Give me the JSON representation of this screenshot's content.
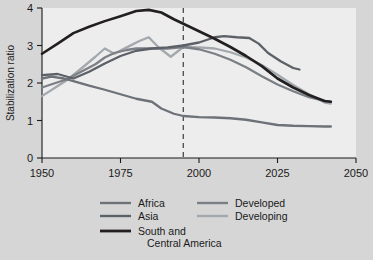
{
  "chart_data": {
    "type": "line",
    "title": "",
    "xlabel": "",
    "ylabel": "Stabilization ratio",
    "xlim": [
      1950,
      2050
    ],
    "ylim": [
      0,
      4
    ],
    "xticks": [
      1950,
      1975,
      2000,
      2025,
      2050
    ],
    "yticks": [
      0,
      1,
      2,
      3,
      4
    ],
    "grid": false,
    "legend_position": "bottom",
    "annotations": [
      {
        "type": "vertical-dashed-line",
        "x": 1995,
        "label": ""
      }
    ],
    "series": [
      {
        "name": "Africa",
        "color": "#6d7278",
        "x": [
          1950,
          1953,
          1957,
          1960,
          1965,
          1970,
          1975,
          1980,
          1985,
          1988,
          1992,
          1995,
          2000,
          2005,
          2010,
          2015,
          2020,
          2025,
          2030,
          2035,
          2040,
          2042
        ],
        "y": [
          2.12,
          2.17,
          2.12,
          2.05,
          1.93,
          1.82,
          1.7,
          1.58,
          1.5,
          1.32,
          1.18,
          1.12,
          1.09,
          1.08,
          1.06,
          1.02,
          0.95,
          0.88,
          0.86,
          0.85,
          0.84,
          0.84
        ]
      },
      {
        "name": "Asia",
        "color": "#5c6168",
        "x": [
          1950,
          1955,
          1960,
          1965,
          1970,
          1975,
          1980,
          1985,
          1990,
          1995,
          2000,
          2005,
          2008,
          2012,
          2016,
          2019,
          2022,
          2026,
          2030,
          2032
        ],
        "y": [
          2.21,
          2.24,
          2.12,
          2.3,
          2.52,
          2.72,
          2.86,
          2.92,
          2.95,
          3.0,
          3.08,
          3.22,
          3.25,
          3.22,
          3.2,
          3.05,
          2.8,
          2.58,
          2.4,
          2.36
        ]
      },
      {
        "name": "South and Central America",
        "color": "#231f20",
        "x": [
          1950,
          1955,
          1960,
          1965,
          1970,
          1975,
          1980,
          1984,
          1988,
          1992,
          1995,
          2000,
          2005,
          2010,
          2015,
          2020,
          2025,
          2030,
          2035,
          2040,
          2042
        ],
        "y": [
          2.78,
          3.05,
          3.33,
          3.5,
          3.65,
          3.78,
          3.92,
          3.95,
          3.88,
          3.7,
          3.58,
          3.38,
          3.18,
          2.96,
          2.72,
          2.45,
          2.12,
          1.88,
          1.68,
          1.52,
          1.5
        ]
      },
      {
        "name": "Developed",
        "color": "#7b8086",
        "x": [
          1950,
          1955,
          1958,
          1962,
          1967,
          1970,
          1973,
          1977,
          1980,
          1985,
          1990,
          1995,
          2000,
          2005,
          2010,
          2015,
          2020,
          2025,
          2030,
          2035,
          2040,
          2042
        ],
        "y": [
          1.88,
          2.02,
          2.1,
          2.28,
          2.5,
          2.68,
          2.8,
          2.88,
          2.92,
          2.92,
          2.92,
          2.96,
          2.9,
          2.78,
          2.62,
          2.42,
          2.18,
          1.96,
          1.78,
          1.62,
          1.52,
          1.5
        ]
      },
      {
        "name": "Developing",
        "color": "#a3a8ad",
        "x": [
          1950,
          1955,
          1958,
          1963,
          1967,
          1970,
          1973,
          1977,
          1981,
          1984,
          1987,
          1991,
          1995,
          2000,
          2005,
          2010,
          2015,
          2020,
          2025,
          2030,
          2035,
          2040,
          2042
        ],
        "y": [
          1.65,
          1.92,
          2.08,
          2.42,
          2.7,
          2.92,
          2.78,
          2.95,
          3.12,
          3.22,
          2.96,
          2.7,
          2.96,
          2.95,
          2.92,
          2.82,
          2.68,
          2.48,
          2.22,
          1.95,
          1.7,
          1.48,
          1.45
        ]
      }
    ]
  },
  "legend": {
    "entries": [
      {
        "label": "Africa"
      },
      {
        "label": "Asia"
      },
      {
        "label": "South and",
        "label2": "Central America"
      },
      {
        "label": "Developed"
      },
      {
        "label": "Developing"
      }
    ]
  },
  "axes": {
    "y_title": "Stabilization ratio",
    "yticks": [
      "0",
      "1",
      "2",
      "3",
      "4"
    ],
    "xticks": [
      "1950",
      "1975",
      "2000",
      "2025",
      "2050"
    ]
  },
  "colors": {
    "page_bg": "#d6d6d6",
    "plot_bg": "#ededed",
    "axis": "#1a1a1a",
    "dashed": "#4a4a4a"
  }
}
